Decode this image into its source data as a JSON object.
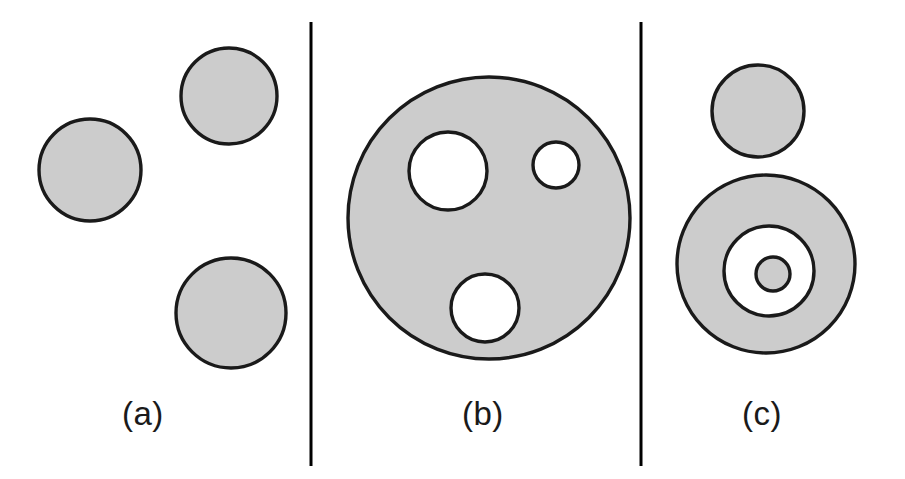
{
  "figure": {
    "width": 905,
    "height": 479,
    "background_color": "#ffffff",
    "blob_fill_color": "#cccccc",
    "blob_outline_color": "#1a1a1a",
    "hole_fill_color": "#ffffff",
    "divider_color": "#000000",
    "label_color": "#1a1a1a"
  },
  "panels": [
    {
      "id": "a",
      "label": "(a)",
      "description": "three separate filled circles",
      "shapes": [
        {
          "name": "circle-a1",
          "type": "filled-circle",
          "cx": 90,
          "cy": 170,
          "r": 51
        },
        {
          "name": "circle-a2",
          "type": "filled-circle",
          "cx": 229,
          "cy": 96,
          "r": 48
        },
        {
          "name": "circle-a3",
          "type": "filled-circle",
          "cx": 231,
          "cy": 313,
          "r": 55
        }
      ]
    },
    {
      "id": "b",
      "label": "(b)",
      "description": "one large filled circle containing three round holes",
      "shapes": [
        {
          "name": "disk-b-outer",
          "type": "filled-circle",
          "cx": 489,
          "cy": 218,
          "r": 141
        },
        {
          "name": "hole-b-large",
          "type": "hole",
          "cx": 448,
          "cy": 171,
          "r": 39
        },
        {
          "name": "hole-b-small",
          "type": "hole",
          "cx": 556,
          "cy": 165,
          "r": 23
        },
        {
          "name": "hole-b-bottom",
          "type": "hole",
          "cx": 485,
          "cy": 308,
          "r": 34
        }
      ]
    },
    {
      "id": "c",
      "label": "(c)",
      "description": "a filled circle above an annulus whose hole contains a small filled dot",
      "shapes": [
        {
          "name": "circle-c-top",
          "type": "filled-circle",
          "cx": 758,
          "cy": 111,
          "r": 46
        },
        {
          "name": "annulus-c-outer",
          "type": "filled-circle",
          "cx": 766,
          "cy": 264,
          "r": 89
        },
        {
          "name": "annulus-c-hole",
          "type": "hole",
          "cx": 769,
          "cy": 271,
          "r": 45
        },
        {
          "name": "dot-c-center",
          "type": "filled-circle",
          "cx": 773,
          "cy": 274,
          "r": 17
        }
      ]
    }
  ],
  "dividers": [
    {
      "name": "divider-left",
      "x": 311,
      "y1": 22,
      "y2": 466
    },
    {
      "name": "divider-right",
      "x": 641,
      "y1": 22,
      "y2": 466
    }
  ],
  "chart_data": {
    "type": "diagram",
    "title": "",
    "subtitle": "",
    "annotations": [
      "(a)",
      "(b)",
      "(c)"
    ]
  }
}
